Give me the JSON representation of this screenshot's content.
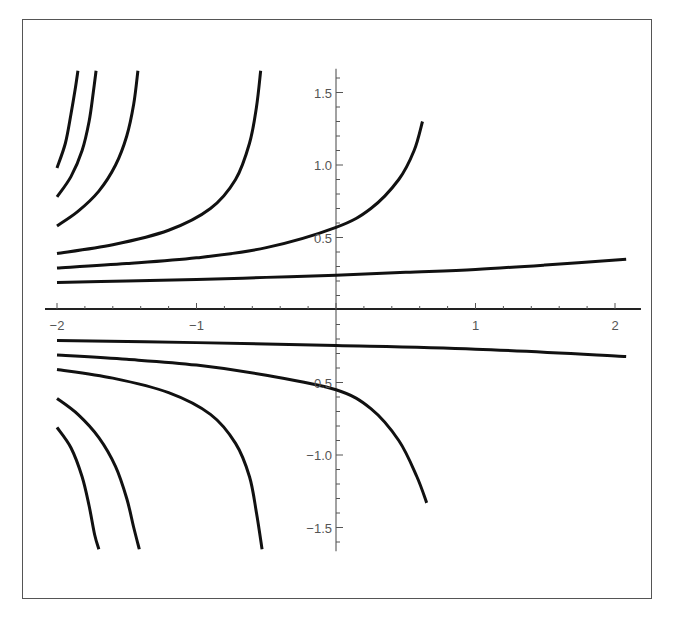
{
  "chart_data": {
    "type": "line",
    "title": "",
    "xlabel": "",
    "ylabel": "",
    "xlim": [
      -2.0,
      2.1
    ],
    "ylim": [
      -1.65,
      1.65
    ],
    "grid": false,
    "legend": null,
    "x_ticks": [
      {
        "value": -2,
        "label": "−2"
      },
      {
        "value": -1,
        "label": "−1"
      },
      {
        "value": 1,
        "label": "1"
      },
      {
        "value": 2,
        "label": "2"
      }
    ],
    "y_ticks": [
      {
        "value": 1.5,
        "label": "1.5"
      },
      {
        "value": 1.0,
        "label": "1.0"
      },
      {
        "value": 0.5,
        "label": "0.5"
      },
      {
        "value": -0.5,
        "label": "0.5"
      },
      {
        "value": -1.0,
        "label": "−1.0"
      },
      {
        "value": -1.5,
        "label": "−1.5"
      }
    ],
    "series": [
      {
        "name": "upper-1",
        "points": [
          [
            -2.0,
            0.19
          ],
          [
            -1.5,
            0.2
          ],
          [
            -1.0,
            0.21
          ],
          [
            -0.5,
            0.225
          ],
          [
            0.0,
            0.24
          ],
          [
            0.5,
            0.26
          ],
          [
            1.0,
            0.28
          ],
          [
            1.5,
            0.31
          ],
          [
            2.08,
            0.35
          ]
        ]
      },
      {
        "name": "upper-2",
        "points": [
          [
            -2.0,
            0.29
          ],
          [
            -1.5,
            0.32
          ],
          [
            -1.0,
            0.36
          ],
          [
            -0.5,
            0.43
          ],
          [
            0.0,
            0.57
          ],
          [
            0.25,
            0.7
          ],
          [
            0.45,
            0.9
          ],
          [
            0.56,
            1.1
          ],
          [
            0.62,
            1.3
          ]
        ]
      },
      {
        "name": "upper-3",
        "points": [
          [
            -2.0,
            0.39
          ],
          [
            -1.6,
            0.45
          ],
          [
            -1.2,
            0.55
          ],
          [
            -0.9,
            0.7
          ],
          [
            -0.72,
            0.9
          ],
          [
            -0.62,
            1.15
          ],
          [
            -0.57,
            1.4
          ],
          [
            -0.54,
            1.65
          ]
        ]
      },
      {
        "name": "upper-4",
        "points": [
          [
            -2.0,
            0.58
          ],
          [
            -1.85,
            0.68
          ],
          [
            -1.7,
            0.82
          ],
          [
            -1.58,
            1.0
          ],
          [
            -1.5,
            1.2
          ],
          [
            -1.45,
            1.42
          ],
          [
            -1.42,
            1.65
          ]
        ]
      },
      {
        "name": "upper-5",
        "points": [
          [
            -2.0,
            0.78
          ],
          [
            -1.9,
            0.92
          ],
          [
            -1.82,
            1.1
          ],
          [
            -1.77,
            1.3
          ],
          [
            -1.74,
            1.5
          ],
          [
            -1.72,
            1.65
          ]
        ]
      },
      {
        "name": "upper-6",
        "points": [
          [
            -2.0,
            0.98
          ],
          [
            -1.94,
            1.15
          ],
          [
            -1.9,
            1.35
          ],
          [
            -1.87,
            1.52
          ],
          [
            -1.85,
            1.65
          ]
        ]
      },
      {
        "name": "lower-1",
        "points": [
          [
            -2.0,
            -0.21
          ],
          [
            -1.0,
            -0.225
          ],
          [
            0.0,
            -0.245
          ],
          [
            1.0,
            -0.27
          ],
          [
            2.08,
            -0.32
          ]
        ]
      },
      {
        "name": "lower-2",
        "points": [
          [
            -2.0,
            -0.31
          ],
          [
            -1.5,
            -0.34
          ],
          [
            -1.0,
            -0.38
          ],
          [
            -0.5,
            -0.45
          ],
          [
            0.0,
            -0.55
          ],
          [
            0.25,
            -0.68
          ],
          [
            0.45,
            -0.9
          ],
          [
            0.58,
            -1.15
          ],
          [
            0.65,
            -1.33
          ]
        ]
      },
      {
        "name": "lower-3",
        "points": [
          [
            -2.0,
            -0.41
          ],
          [
            -1.6,
            -0.47
          ],
          [
            -1.2,
            -0.57
          ],
          [
            -0.9,
            -0.72
          ],
          [
            -0.72,
            -0.92
          ],
          [
            -0.62,
            -1.15
          ],
          [
            -0.57,
            -1.4
          ],
          [
            -0.53,
            -1.65
          ]
        ]
      },
      {
        "name": "lower-4",
        "points": [
          [
            -2.0,
            -0.61
          ],
          [
            -1.85,
            -0.72
          ],
          [
            -1.7,
            -0.88
          ],
          [
            -1.58,
            -1.08
          ],
          [
            -1.5,
            -1.3
          ],
          [
            -1.45,
            -1.5
          ],
          [
            -1.41,
            -1.65
          ]
        ]
      },
      {
        "name": "lower-5",
        "points": [
          [
            -2.0,
            -0.81
          ],
          [
            -1.9,
            -0.95
          ],
          [
            -1.82,
            -1.15
          ],
          [
            -1.77,
            -1.35
          ],
          [
            -1.73,
            -1.55
          ],
          [
            -1.7,
            -1.65
          ]
        ]
      }
    ],
    "line_color": "#111111"
  },
  "page": {
    "top_cut_text": "                 ...g ..."
  }
}
